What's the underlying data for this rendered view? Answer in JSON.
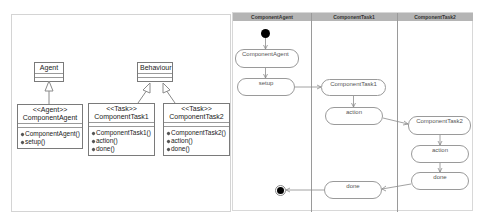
{
  "class_diagram": {
    "classes": [
      {
        "id": "agent",
        "name": "Agent",
        "stereotype": "",
        "operations": []
      },
      {
        "id": "component-agent",
        "name": "ComponentAgent",
        "stereotype": "<<Agent>>",
        "operations": [
          "ComponentAgent()",
          "setup()"
        ]
      },
      {
        "id": "behaviour",
        "name": "Behaviour",
        "stereotype": "",
        "operations": []
      },
      {
        "id": "component-task1",
        "name": "ComponentTask1",
        "stereotype": "<<Task>>",
        "operations": [
          "ComponentTask1()",
          "action()",
          "done()"
        ]
      },
      {
        "id": "component-task2",
        "name": "ComponentTask2",
        "stereotype": "<<Task>>",
        "operations": [
          "ComponentTask2()",
          "action()",
          "done()"
        ]
      }
    ],
    "generalizations": [
      {
        "from": "ComponentAgent",
        "to": "Agent"
      },
      {
        "from": "ComponentTask1",
        "to": "Behaviour"
      },
      {
        "from": "ComponentTask2",
        "to": "Behaviour"
      }
    ]
  },
  "activity_diagram": {
    "swimlanes": [
      "ComponentAgent",
      "ComponentTask1",
      "ComponentTask2"
    ],
    "nodes": {
      "agent_init": "ComponentAgent",
      "agent_setup": "setup",
      "task1_init": "ComponentTask1",
      "task1_action": "action",
      "task2_init": "ComponentTask2",
      "task2_action": "action",
      "task2_done": "done",
      "task1_done": "done"
    },
    "flow": [
      "start",
      "ComponentAgent",
      "setup",
      "ComponentTask1",
      "action",
      "ComponentTask2",
      "action",
      "done",
      "done",
      "end"
    ]
  },
  "colors": {
    "lane_header_bg": "#b5b5b5",
    "border": "#9a9a9a",
    "node_fill": "#ffffff"
  }
}
